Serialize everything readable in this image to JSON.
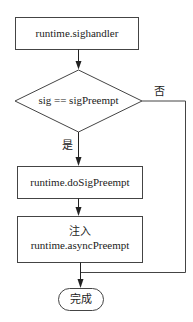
{
  "diagram": {
    "nodes": {
      "start": {
        "type": "process",
        "label": "runtime.sighandler"
      },
      "decision": {
        "type": "decision",
        "label": "sig == sigPreempt"
      },
      "do_preempt": {
        "type": "process",
        "label": "runtime.doSigPreempt"
      },
      "inject": {
        "type": "process",
        "line1": "注入",
        "line2": "runtime.asyncPreempt"
      },
      "end": {
        "type": "terminator",
        "label": "完成"
      }
    },
    "edges": {
      "yes_label": "是",
      "no_label": "否"
    },
    "colors": {
      "stroke": "#333333",
      "background": "#ffffff"
    }
  }
}
